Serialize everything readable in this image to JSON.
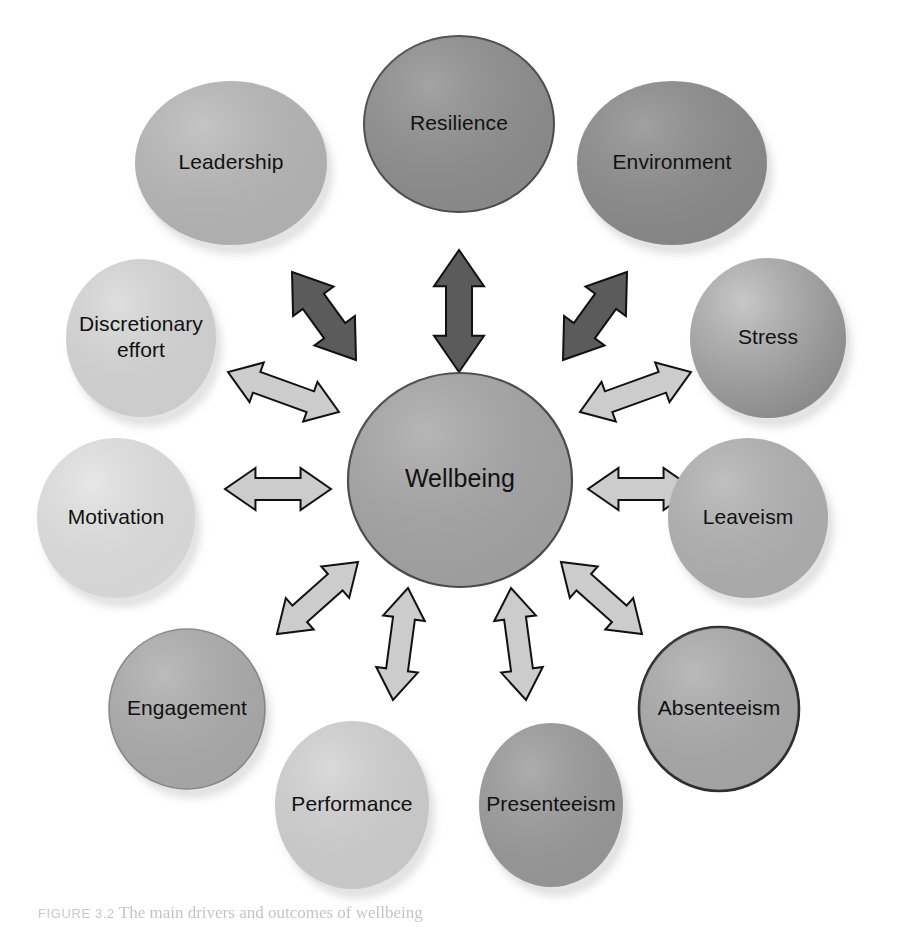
{
  "figure": {
    "type": "hub-and-spoke relationship diagram",
    "center": {
      "id": "wellbeing",
      "label": "Wellbeing",
      "shape": "ellipse",
      "cx": 460,
      "cy": 480,
      "rx": 112,
      "ry": 107,
      "fill": "#a6a6a6",
      "stroke": "#4a4a4a",
      "stroke_width": 2.2,
      "shadow": false
    },
    "nodes": [
      {
        "id": "leadership",
        "label": "Leadership",
        "shape": "ellipse",
        "cx": 231,
        "cy": 163,
        "rx": 96,
        "ry": 82,
        "fill": "#b8b8b8",
        "stroke": "none",
        "stroke_width": 0,
        "shadow": true
      },
      {
        "id": "resilience",
        "label": "Resilience",
        "shape": "ellipse",
        "cx": 459,
        "cy": 124,
        "rx": 95,
        "ry": 88,
        "fill": "#8f8f8f",
        "stroke": "#4d4d4d",
        "stroke_width": 2.0,
        "shadow": false
      },
      {
        "id": "environment",
        "label": "Environment",
        "shape": "ellipse",
        "cx": 672,
        "cy": 163,
        "rx": 95,
        "ry": 82,
        "fill": "#8c8c8c",
        "stroke": "none",
        "stroke_width": 0,
        "shadow": true
      },
      {
        "id": "discretionary-effort",
        "label": "Discretionary effort",
        "label_lines": [
          "Discretionary",
          "effort"
        ],
        "shape": "ellipse",
        "cx": 141,
        "cy": 338,
        "rx": 75,
        "ry": 79,
        "fill": "#d8d8d8",
        "stroke": "none",
        "stroke_width": 0,
        "shadow": true
      },
      {
        "id": "stress",
        "label": "Stress",
        "shape": "ellipse",
        "cx": 768,
        "cy": 338,
        "rx": 78,
        "ry": 80,
        "fill": "#a0a0a0",
        "stroke": "none",
        "stroke_width": 0,
        "shadow": true,
        "gradient": true
      },
      {
        "id": "motivation",
        "label": "Motivation",
        "shape": "ellipse",
        "cx": 116,
        "cy": 518,
        "rx": 79,
        "ry": 80,
        "fill": "#e2e2e2",
        "stroke": "none",
        "stroke_width": 0,
        "shadow": true
      },
      {
        "id": "leaveism",
        "label": "Leaveism",
        "shape": "ellipse",
        "cx": 748,
        "cy": 518,
        "rx": 80,
        "ry": 80,
        "fill": "#b2b2b2",
        "stroke": "none",
        "stroke_width": 0,
        "shadow": true
      },
      {
        "id": "engagement",
        "label": "Engagement",
        "shape": "ellipse",
        "cx": 187,
        "cy": 709,
        "rx": 78,
        "ry": 80,
        "fill": "#adadad",
        "stroke": "#8a8a8a",
        "stroke_width": 1.6,
        "shadow": true
      },
      {
        "id": "absenteeism",
        "label": "Absenteeism",
        "shape": "ellipse",
        "cx": 719,
        "cy": 709,
        "rx": 80,
        "ry": 82,
        "fill": "#ababab",
        "stroke": "#2e2e2e",
        "stroke_width": 2.6,
        "shadow": false
      },
      {
        "id": "performance",
        "label": "Performance",
        "shape": "ellipse",
        "cx": 352,
        "cy": 805,
        "rx": 77,
        "ry": 84,
        "fill": "#d2d2d2",
        "stroke": "none",
        "stroke_width": 0,
        "shadow": true
      },
      {
        "id": "presenteeism",
        "label": "Presenteeism",
        "shape": "ellipse",
        "cx": 551,
        "cy": 805,
        "rx": 72,
        "ry": 82,
        "fill": "#9b9b9b",
        "stroke": "none",
        "stroke_width": 0,
        "shadow": true
      }
    ],
    "arrows": [
      {
        "id": "arrow-wellbeing-leadership",
        "style": "dark",
        "from": "wellbeing",
        "to": "leadership",
        "x1": 356,
        "y1": 360,
        "x2": 292,
        "y2": 272,
        "thickness": 26,
        "head": 25
      },
      {
        "id": "arrow-wellbeing-resilience",
        "style": "dark",
        "from": "wellbeing",
        "to": "resilience",
        "x1": 459,
        "y1": 372,
        "x2": 459,
        "y2": 250,
        "thickness": 26,
        "head": 25
      },
      {
        "id": "arrow-wellbeing-environment",
        "style": "dark",
        "from": "wellbeing",
        "to": "environment",
        "x1": 563,
        "y1": 360,
        "x2": 627,
        "y2": 272,
        "thickness": 26,
        "head": 25
      },
      {
        "id": "arrow-wellbeing-discretionary-effort",
        "style": "light",
        "from": "wellbeing",
        "to": "discretionary-effort",
        "x1": 339,
        "y1": 412,
        "x2": 228,
        "y2": 372,
        "thickness": 22,
        "head": 21
      },
      {
        "id": "arrow-wellbeing-stress",
        "style": "light",
        "from": "wellbeing",
        "to": "stress",
        "x1": 580,
        "y1": 412,
        "x2": 691,
        "y2": 372,
        "thickness": 22,
        "head": 21
      },
      {
        "id": "arrow-wellbeing-motivation",
        "style": "light",
        "from": "wellbeing",
        "to": "motivation",
        "x1": 331,
        "y1": 489,
        "x2": 225,
        "y2": 489,
        "thickness": 22,
        "head": 21
      },
      {
        "id": "arrow-wellbeing-leaveism",
        "style": "light",
        "from": "wellbeing",
        "to": "leaveism",
        "x1": 588,
        "y1": 489,
        "x2": 694,
        "y2": 489,
        "thickness": 22,
        "head": 21
      },
      {
        "id": "arrow-wellbeing-engagement",
        "style": "light",
        "from": "wellbeing",
        "to": "engagement",
        "x1": 358,
        "y1": 562,
        "x2": 277,
        "y2": 634,
        "thickness": 22,
        "head": 21
      },
      {
        "id": "arrow-wellbeing-absenteeism",
        "style": "light",
        "from": "wellbeing",
        "to": "absenteeism",
        "x1": 561,
        "y1": 562,
        "x2": 642,
        "y2": 634,
        "thickness": 22,
        "head": 21
      },
      {
        "id": "arrow-wellbeing-performance",
        "style": "light",
        "from": "wellbeing",
        "to": "performance",
        "x1": 408,
        "y1": 588,
        "x2": 393,
        "y2": 700,
        "thickness": 22,
        "head": 21
      },
      {
        "id": "arrow-wellbeing-presenteeism",
        "style": "light",
        "from": "wellbeing",
        "to": "presenteeism",
        "x1": 511,
        "y1": 588,
        "x2": 526,
        "y2": 700,
        "thickness": 22,
        "head": 21
      }
    ],
    "arrow_styles": {
      "dark": {
        "fill": "#5b5b5b",
        "stroke": "#111111",
        "stroke_width": 2.0
      },
      "light": {
        "fill": "#cccccc",
        "stroke": "#111111",
        "stroke_width": 2.0
      }
    },
    "background": "#ffffff"
  },
  "caption": {
    "figure_number": "FIGURE 3.2",
    "text": "The main drivers and outcomes of wellbeing",
    "note": "caption is cropped at the bottom edge of the image"
  }
}
